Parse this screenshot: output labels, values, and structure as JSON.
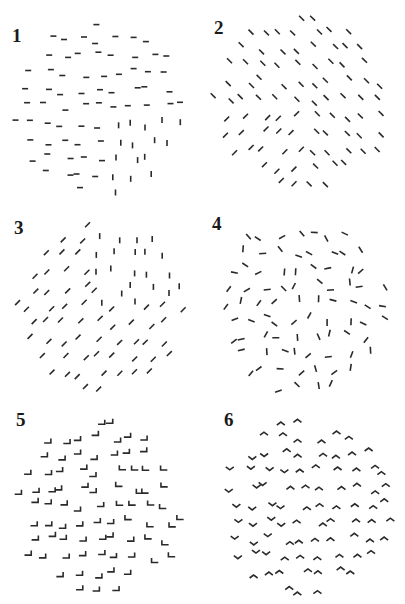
{
  "figure": {
    "panels": [
      {
        "label": "1",
        "background_element": "horizontal dash",
        "figure_element": "vertical dash",
        "figure_region": "lower-right"
      },
      {
        "label": "2",
        "background_element": "backslash diagonal",
        "figure_element": "forward-slash diagonal",
        "figure_region": "lower-left"
      },
      {
        "label": "3",
        "background_element": "forward-slash diagonal",
        "figure_element": "vertical dash",
        "figure_region": "upper-right"
      },
      {
        "label": "4",
        "background_element": "randomly oriented dash",
        "figure_element": "randomly oriented dash",
        "figure_region": "none"
      },
      {
        "label": "5",
        "background_element": "corner opening up-left",
        "figure_element": "corner opening up-right",
        "figure_region": "right"
      },
      {
        "label": "6",
        "background_element": "upward chevron",
        "figure_element": "downward chevron",
        "figure_region": "left"
      }
    ]
  }
}
